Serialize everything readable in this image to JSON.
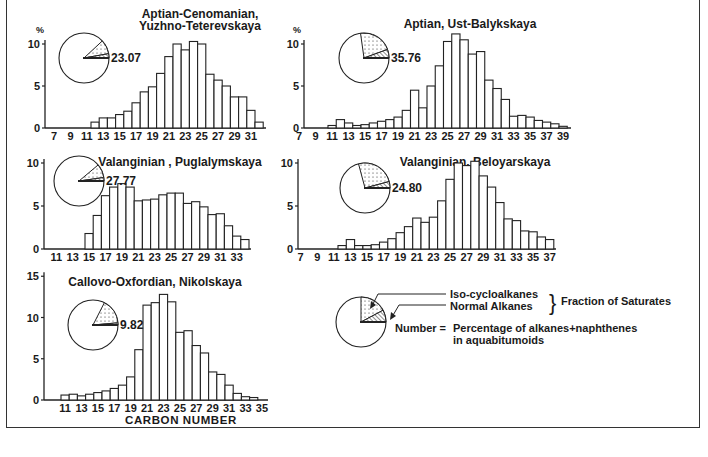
{
  "figure": {
    "x_axis_label": "CARBON NUMBER",
    "percent_symbol": "%"
  },
  "legend": {
    "iso_label": "Iso-cycloalkanes",
    "normal_label": "Normal Alkanes",
    "brace_label": "Fraction of Saturates",
    "number_label": "Number =",
    "number_desc_line1": "Percentage of alkanes+naphthenes",
    "number_desc_line2": "in aquabitumoids"
  },
  "chart_data": [
    {
      "type": "bar",
      "title": "Aptian-Cenomanian, Yuzhno-Teterevskaya",
      "title_lines": [
        "Aptian-Cenomanian,",
        "Yuzhno-Teterevskaya"
      ],
      "xlabel": "Carbon number",
      "ylabel": "%",
      "ylim": [
        0,
        10
      ],
      "yticks": [
        0,
        5,
        10
      ],
      "xticks": [
        7,
        9,
        11,
        13,
        15,
        17,
        19,
        21,
        23,
        25,
        27,
        29,
        31
      ],
      "x_start": 6,
      "x": [
        12,
        13,
        14,
        15,
        16,
        17,
        18,
        19,
        20,
        21,
        22,
        23,
        24,
        25,
        26,
        27,
        28,
        29,
        30,
        31,
        32
      ],
      "values": [
        0.7,
        1.2,
        1.2,
        1.6,
        2.0,
        3.0,
        4.3,
        4.9,
        6.5,
        8.5,
        10.0,
        9.3,
        10.3,
        10.0,
        6.4,
        5.7,
        5.0,
        3.7,
        3.7,
        2.1,
        0.7
      ],
      "pie_value": "23.07",
      "pie": {
        "iso_deg": 33,
        "normal_deg": 10
      },
      "show_percent": true
    },
    {
      "type": "bar",
      "title": "Aptian, Ust-Balykskaya",
      "title_lines": [
        "Aptian,  Ust-Balykskaya"
      ],
      "xlabel": "Carbon number",
      "ylabel": "%",
      "ylim": [
        0,
        10
      ],
      "yticks": [
        0,
        5,
        10
      ],
      "xticks": [
        7,
        9,
        11,
        13,
        15,
        17,
        19,
        21,
        23,
        25,
        27,
        29,
        31,
        33,
        35,
        37,
        39
      ],
      "x_start": 6,
      "x": [
        11,
        12,
        13,
        14,
        15,
        16,
        17,
        18,
        19,
        20,
        21,
        22,
        23,
        24,
        25,
        26,
        27,
        28,
        29,
        30,
        31,
        32,
        33,
        34,
        35,
        36,
        37,
        38,
        39
      ],
      "values": [
        0.3,
        1.0,
        0.6,
        0.3,
        0.4,
        0.6,
        0.8,
        1.0,
        1.3,
        2.1,
        4.5,
        2.4,
        5.0,
        7.4,
        10.3,
        11.2,
        10.5,
        8.8,
        9.1,
        5.7,
        4.7,
        3.4,
        1.4,
        1.5,
        1.3,
        0.9,
        0.7,
        0.5,
        0.2
      ],
      "pie_value": "35.76",
      "pie": {
        "iso_deg": 78,
        "normal_deg": 20
      },
      "show_percent": true
    },
    {
      "type": "bar",
      "title": "Valanginian, Puglalymskaya",
      "title_lines": [
        "Valanginian ,  Puglalymskaya"
      ],
      "xlabel": "Carbon number",
      "ylabel": "%",
      "ylim": [
        0,
        10
      ],
      "yticks": [
        0,
        5,
        10
      ],
      "xticks": [
        11,
        13,
        15,
        17,
        19,
        21,
        23,
        25,
        27,
        29,
        31,
        33
      ],
      "x_start": 10,
      "x": [
        15,
        16,
        17,
        18,
        19,
        20,
        21,
        22,
        23,
        24,
        25,
        26,
        27,
        28,
        29,
        30,
        31,
        32,
        33,
        34
      ],
      "values": [
        1.8,
        3.9,
        6.2,
        7.2,
        7.6,
        7.2,
        5.6,
        5.7,
        5.8,
        6.3,
        6.5,
        6.5,
        5.3,
        5.5,
        4.9,
        4.0,
        4.1,
        2.7,
        1.5,
        1.1
      ],
      "pie_value": "27.77",
      "pie": {
        "iso_deg": 32,
        "normal_deg": 8
      },
      "show_percent": false
    },
    {
      "type": "bar",
      "title": "Valanginian, Beloyarskaya",
      "title_lines": [
        "Valanginian,  Beloyarskaya"
      ],
      "xlabel": "Carbon number",
      "ylabel": "%",
      "ylim": [
        0,
        10
      ],
      "yticks": [
        0,
        5,
        10
      ],
      "xticks": [
        7,
        9,
        11,
        13,
        15,
        17,
        19,
        21,
        23,
        25,
        27,
        29,
        31,
        33,
        35,
        37
      ],
      "x_start": 6,
      "x": [
        12,
        13,
        14,
        15,
        16,
        17,
        18,
        19,
        20,
        21,
        22,
        23,
        24,
        25,
        26,
        27,
        28,
        29,
        30,
        31,
        32,
        33,
        34,
        35,
        36,
        37
      ],
      "values": [
        0.4,
        1.1,
        0.4,
        0.4,
        0.5,
        0.8,
        1.2,
        1.9,
        2.6,
        3.6,
        3.1,
        3.7,
        5.6,
        8.1,
        10.0,
        9.7,
        10.2,
        8.5,
        7.2,
        5.4,
        3.5,
        3.3,
        2.1,
        2.0,
        1.4,
        1.1
      ],
      "pie_value": "24.80",
      "pie": {
        "iso_deg": 90,
        "normal_deg": 15
      },
      "show_percent": false
    },
    {
      "type": "bar",
      "title": "Callovo-Oxfordian, Nikolskaya",
      "title_lines": [
        "Callovo-Oxfordian,  Nikolskaya"
      ],
      "xlabel": "CARBON NUMBER",
      "ylabel": "%",
      "ylim": [
        0,
        15
      ],
      "yticks": [
        0,
        5,
        10,
        15
      ],
      "xticks": [
        11,
        13,
        15,
        17,
        19,
        21,
        23,
        25,
        27,
        29,
        31,
        33,
        35
      ],
      "x_start": 10,
      "x": [
        11,
        12,
        13,
        14,
        15,
        16,
        17,
        18,
        19,
        20,
        21,
        22,
        23,
        24,
        25,
        26,
        27,
        28,
        29,
        30,
        31,
        32,
        33,
        34,
        35
      ],
      "values": [
        0.6,
        0.7,
        0.5,
        0.7,
        0.9,
        1.1,
        1.4,
        1.8,
        2.8,
        6.1,
        11.5,
        11.8,
        12.8,
        11.9,
        8.2,
        8.4,
        6.6,
        5.7,
        3.4,
        3.1,
        1.8,
        0.8,
        0.4,
        0.3,
        0.0
      ],
      "pie_value": "9.82",
      "pie": {
        "iso_deg": 58,
        "normal_deg": 5
      },
      "show_percent": false
    }
  ]
}
